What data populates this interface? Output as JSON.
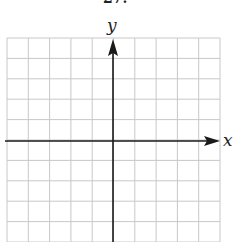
{
  "figure": {
    "top_label": "27.",
    "x_axis_label": "x",
    "y_axis_label": "y",
    "grid": {
      "columns": 10,
      "rows": 10,
      "left": 7,
      "top": 38,
      "cell_width": 21.3,
      "cell_height": 20.4,
      "line_color": "#c8c8c8"
    },
    "axes": {
      "color": "#1a1a1a",
      "origin_x": 113,
      "origin_y": 141
    }
  }
}
